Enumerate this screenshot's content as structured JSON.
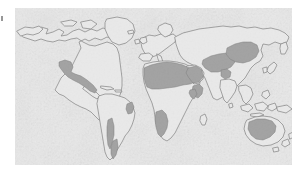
{
  "figure": {
    "kind": "world-map-thematic",
    "caption": "",
    "alt_text": "World map with arid and desert regions shaded in dark grey",
    "background_color": "#ffffff"
  },
  "margin": {
    "mark_label": "page margin mark"
  },
  "map": {
    "title": "",
    "projection_note": "rectangular world map",
    "panel": {
      "left": 15,
      "top": 8,
      "width": 277,
      "height": 157
    },
    "colors": {
      "ocean_background": "#dedede",
      "ocean_background_light": "#e9e9e9",
      "land_fill": "#e4e4e4",
      "coastline_stroke": "#6a6a6a",
      "highlight_fill": "#8b8b8b",
      "highlight_stroke": "#5d5d5d",
      "margin_mark": "#6f6f6f"
    },
    "legend": {
      "visible": false,
      "entries": [
        {
          "label": "Arid / desert region",
          "color": "#8b8b8b"
        },
        {
          "label": "Other land",
          "color": "#e4e4e4"
        }
      ]
    },
    "landmasses": [
      {
        "name": "North America"
      },
      {
        "name": "Greenland"
      },
      {
        "name": "South America"
      },
      {
        "name": "Europe"
      },
      {
        "name": "Africa"
      },
      {
        "name": "Asia"
      },
      {
        "name": "Australia"
      },
      {
        "name": "New Zealand"
      },
      {
        "name": "Japan"
      },
      {
        "name": "Indonesia"
      },
      {
        "name": "Madagascar"
      },
      {
        "name": "British Isles"
      }
    ],
    "highlighted_regions": [
      {
        "name": "Sahara Desert",
        "continent": "Africa"
      },
      {
        "name": "Arabian Desert",
        "continent": "Asia"
      },
      {
        "name": "Iranian and Central Asian deserts",
        "continent": "Asia"
      },
      {
        "name": "Gobi and Taklamakan deserts",
        "continent": "Asia"
      },
      {
        "name": "Thar Desert",
        "continent": "Asia"
      },
      {
        "name": "Namib and Kalahari deserts",
        "continent": "Africa"
      },
      {
        "name": "Horn of Africa arid belt",
        "continent": "Africa"
      },
      {
        "name": "Great Basin, Sonoran and Chihuahuan deserts",
        "continent": "North America"
      },
      {
        "name": "Atacama Desert",
        "continent": "South America"
      },
      {
        "name": "Patagonian Desert",
        "continent": "South America"
      },
      {
        "name": "Caatinga dry region",
        "continent": "South America"
      },
      {
        "name": "Australian Outback deserts",
        "continent": "Australia"
      }
    ]
  }
}
